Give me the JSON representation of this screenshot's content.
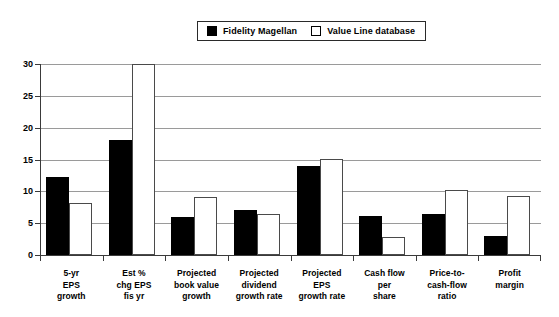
{
  "legend": {
    "position": "top-center",
    "entries": [
      {
        "label": "Fidelity Magellan",
        "swatch": "filled-square-icon",
        "color": "#000000"
      },
      {
        "label": "Value Line database",
        "swatch": "hollow-square-icon",
        "color": "#ffffff"
      }
    ]
  },
  "chart_data": {
    "type": "bar",
    "title": "",
    "subtitle": "",
    "xlabel": "",
    "ylabel": "",
    "ylim": [
      0,
      30
    ],
    "yticks": [
      0,
      5,
      10,
      15,
      20,
      25,
      30
    ],
    "ytick_labels": [
      "0",
      "5",
      "10",
      "15",
      "20",
      "25",
      "30"
    ],
    "grid": true,
    "legend_position": "top-center",
    "categories": [
      "5-yr EPS growth",
      "Est % chg EPS fis yr",
      "Projected book value growth",
      "Projected dividend growth rate",
      "Projected EPS growth rate",
      "Cash flow per share",
      "Price-to-cash-flow ratio",
      "Profit margin"
    ],
    "category_lines": [
      [
        "5-yr",
        "EPS",
        "growth"
      ],
      [
        "Est %",
        "chg EPS",
        "fis yr"
      ],
      [
        "Projected",
        "book value",
        "growth"
      ],
      [
        "Projected",
        "dividend",
        "growth rate"
      ],
      [
        "Projected",
        "EPS",
        "growth rate"
      ],
      [
        "Cash flow",
        "per",
        "share"
      ],
      [
        "Price-to-",
        "cash-flow",
        "ratio"
      ],
      [
        "Profit",
        "margin"
      ]
    ],
    "series": [
      {
        "name": "Fidelity Magellan",
        "color": "#000000",
        "values": [
          12.2,
          18.0,
          6.0,
          7.1,
          14.0,
          6.2,
          6.4,
          3.0
        ]
      },
      {
        "name": "Value Line database",
        "color": "#ffffff",
        "values": [
          8.2,
          30.0,
          9.1,
          6.4,
          15.1,
          2.8,
          10.2,
          9.3
        ],
        "clipped": [
          false,
          true,
          false,
          false,
          false,
          false,
          false,
          false
        ]
      }
    ]
  }
}
